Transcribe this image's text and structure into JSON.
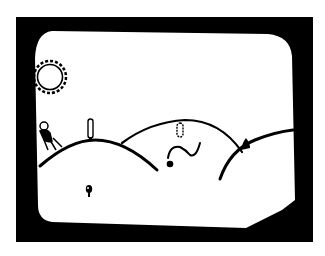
{
  "scene": {
    "description": "Black-and-white drawn game screen on a CRT monitor: rolling desert hills with a sun, cacti, a character, a snake and a small creature",
    "colors": {
      "background": "#ffffff",
      "frame": "#000000",
      "screen": "#ffffff",
      "ink": "#000000"
    },
    "objects": [
      {
        "name": "sun",
        "x": 50,
        "y": 77,
        "r": 13
      },
      {
        "name": "player-character",
        "x": 51,
        "y": 137
      },
      {
        "name": "cactus-left",
        "x": 90,
        "y": 129
      },
      {
        "name": "cactus-middle",
        "x": 180,
        "y": 130
      },
      {
        "name": "snake",
        "x": 185,
        "y": 150
      },
      {
        "name": "rock",
        "x": 245,
        "y": 144
      },
      {
        "name": "small-creature",
        "x": 89,
        "y": 191
      }
    ]
  }
}
